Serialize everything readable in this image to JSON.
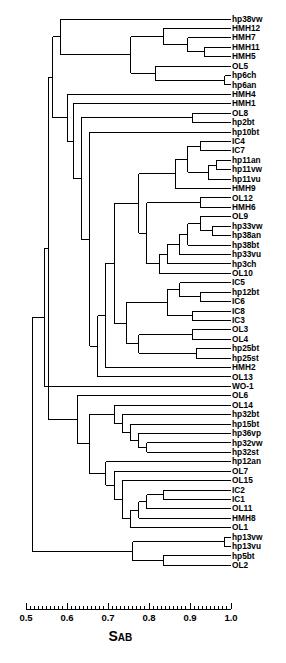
{
  "figure": {
    "kind": "dendrogram",
    "orientation": "horizontal-right-facing",
    "axis_title_main": "S",
    "axis_title_sub": "AB"
  },
  "axis": {
    "label": "SAB",
    "min": 0.5,
    "max": 1.0,
    "major_ticks": [
      0.5,
      0.6,
      0.7,
      0.8,
      0.9,
      1.0
    ],
    "tick_labels": [
      "0.5",
      "0.6",
      "0.7",
      "0.8",
      "0.9",
      "1.0"
    ],
    "minor_tick_step": 0.01,
    "pixel_min_x": 26,
    "pixel_max_x": 231
  },
  "chart_data": {
    "type": "dendrogram",
    "title": "",
    "xlabel": "SAB",
    "ylabel": "",
    "xlim": [
      0.5,
      1.0
    ],
    "grid": false,
    "legend": "none",
    "n_leaves": 64,
    "leaves": [
      "hp38vw",
      "HMH12",
      "HMH7",
      "HMH11",
      "HMH5",
      "OL5",
      "hp6ch",
      "hp6an",
      "HMH4",
      "HMH1",
      "OL8",
      "hp2bt",
      "hp10bt",
      "IC4",
      "IC7",
      "hp11an",
      "hp11vw",
      "hp11vu",
      "HMH9",
      "OL12",
      "HMH6",
      "OL9",
      "hp33vw",
      "hp38an",
      "hp38bt",
      "hp33vu",
      "hp3ch",
      "OL10",
      "IC5",
      "hp12bt",
      "IC6",
      "IC8",
      "IC3",
      "OL3",
      "OL4",
      "hp25bt",
      "hp25st",
      "HMH2",
      "OL13",
      "WO-1",
      "OL6",
      "OL14",
      "hp32bt",
      "hp15bt",
      "hp36vp",
      "hp32vw",
      "hp32st",
      "hp12an",
      "OL7",
      "OL15",
      "IC2",
      "IC1",
      "OL11",
      "HMH8",
      "OL1",
      "hp13vw",
      "hp13vu",
      "hp5bt",
      "OL2"
    ],
    "leaf_tip_similarity": 1.0,
    "merges": [
      {
        "id": "m1",
        "members": [
          "hp6ch",
          "hp6an"
        ],
        "similarity": 0.985
      },
      {
        "id": "m2",
        "members": [
          "HMH11",
          "HMH5"
        ],
        "similarity": 0.935
      },
      {
        "id": "m3",
        "members": [
          "HMH7",
          "m2"
        ],
        "similarity": 0.895
      },
      {
        "id": "m4",
        "members": [
          "HMH12",
          "m3"
        ],
        "similarity": 0.835
      },
      {
        "id": "m5",
        "members": [
          "OL5",
          "m1"
        ],
        "similarity": 0.815
      },
      {
        "id": "m6",
        "members": [
          "m4",
          "m5"
        ],
        "similarity": 0.755
      },
      {
        "id": "m7",
        "members": [
          "hp38vw",
          "m6"
        ],
        "similarity": 0.585
      },
      {
        "id": "m8",
        "members": [
          "OL8",
          "hp2bt"
        ],
        "similarity": 0.905
      },
      {
        "id": "m9",
        "members": [
          "IC4",
          "IC7"
        ],
        "similarity": 0.925
      },
      {
        "id": "m10",
        "members": [
          "hp11an",
          "hp11vw"
        ],
        "similarity": 0.965
      },
      {
        "id": "m11",
        "members": [
          "m10",
          "hp11vu"
        ],
        "similarity": 0.945
      },
      {
        "id": "m12",
        "members": [
          "m9",
          "m11"
        ],
        "similarity": 0.895
      },
      {
        "id": "m13",
        "members": [
          "m12",
          "HMH9"
        ],
        "similarity": 0.865
      },
      {
        "id": "m14",
        "members": [
          "OL12",
          "HMH6"
        ],
        "similarity": 0.925
      },
      {
        "id": "m15",
        "members": [
          "hp33vw",
          "hp38an"
        ],
        "similarity": 0.955
      },
      {
        "id": "m16",
        "members": [
          "OL9",
          "m15"
        ],
        "similarity": 0.925
      },
      {
        "id": "m17",
        "members": [
          "m16",
          "hp38bt"
        ],
        "similarity": 0.895
      },
      {
        "id": "m18",
        "members": [
          "m17",
          "hp33vu"
        ],
        "similarity": 0.875
      },
      {
        "id": "m19",
        "members": [
          "m18",
          "hp3ch"
        ],
        "similarity": 0.845
      },
      {
        "id": "m20",
        "members": [
          "m19",
          "OL10"
        ],
        "similarity": 0.825
      },
      {
        "id": "m21",
        "members": [
          "m14",
          "m20"
        ],
        "similarity": 0.795
      },
      {
        "id": "m22",
        "members": [
          "m13",
          "m21"
        ],
        "similarity": 0.775
      },
      {
        "id": "m23",
        "members": [
          "hp12bt",
          "IC6"
        ],
        "similarity": 0.925
      },
      {
        "id": "m24",
        "members": [
          "IC5",
          "m23"
        ],
        "similarity": 0.875
      },
      {
        "id": "m25",
        "members": [
          "IC8",
          "IC3"
        ],
        "similarity": 0.905
      },
      {
        "id": "m26",
        "members": [
          "m24",
          "m25"
        ],
        "similarity": 0.845
      },
      {
        "id": "m27",
        "members": [
          "OL3",
          "OL4"
        ],
        "similarity": 0.905
      },
      {
        "id": "m28",
        "members": [
          "hp25bt",
          "hp25st"
        ],
        "similarity": 0.915
      },
      {
        "id": "m29",
        "members": [
          "m27",
          "m28"
        ],
        "similarity": 0.775
      },
      {
        "id": "m30",
        "members": [
          "m26",
          "m29"
        ],
        "similarity": 0.745
      },
      {
        "id": "m31",
        "members": [
          "m22",
          "m30"
        ],
        "similarity": 0.715
      },
      {
        "id": "m32",
        "members": [
          "m31",
          "HMH2"
        ],
        "similarity": 0.695
      },
      {
        "id": "m33",
        "members": [
          "m32",
          "OL13"
        ],
        "similarity": 0.675
      },
      {
        "id": "m34",
        "members": [
          "hp10bt",
          "m33"
        ],
        "similarity": 0.655
      },
      {
        "id": "m35",
        "members": [
          "m8",
          "m34"
        ],
        "similarity": 0.635
      },
      {
        "id": "m36",
        "members": [
          "HMH1",
          "m35"
        ],
        "similarity": 0.615
      },
      {
        "id": "m37",
        "members": [
          "HMH4",
          "m36"
        ],
        "similarity": 0.6
      },
      {
        "id": "m38",
        "members": [
          "m7",
          "m37"
        ],
        "similarity": 0.565
      },
      {
        "id": "m39",
        "members": [
          "hp32vw",
          "hp32st"
        ],
        "similarity": 0.795
      },
      {
        "id": "m40",
        "members": [
          "hp36vp",
          "m39"
        ],
        "similarity": 0.775
      },
      {
        "id": "m41",
        "members": [
          "hp15bt",
          "m40"
        ],
        "similarity": 0.755
      },
      {
        "id": "m42",
        "members": [
          "hp32bt",
          "m41"
        ],
        "similarity": 0.735
      },
      {
        "id": "m43",
        "members": [
          "OL14",
          "m42"
        ],
        "similarity": 0.715
      },
      {
        "id": "m44",
        "members": [
          "IC2",
          "IC1"
        ],
        "similarity": 0.835
      },
      {
        "id": "m45",
        "members": [
          "m44",
          "OL11"
        ],
        "similarity": 0.795
      },
      {
        "id": "m46",
        "members": [
          "m45",
          "HMH8"
        ],
        "similarity": 0.775
      },
      {
        "id": "m47",
        "members": [
          "m46",
          "OL1"
        ],
        "similarity": 0.755
      },
      {
        "id": "m48",
        "members": [
          "OL15",
          "m47"
        ],
        "similarity": 0.735
      },
      {
        "id": "m49",
        "members": [
          "OL7",
          "m48"
        ],
        "similarity": 0.715
      },
      {
        "id": "m50",
        "members": [
          "hp12an",
          "m49"
        ],
        "similarity": 0.695
      },
      {
        "id": "m51",
        "members": [
          "m43",
          "m50"
        ],
        "similarity": 0.655
      },
      {
        "id": "m52",
        "members": [
          "OL6",
          "m51"
        ],
        "similarity": 0.625
      },
      {
        "id": "m53",
        "members": [
          "m38",
          "m52"
        ],
        "similarity": 0.555
      },
      {
        "id": "m54",
        "members": [
          "WO-1",
          "m53"
        ],
        "similarity": 0.545
      },
      {
        "id": "m55",
        "members": [
          "hp13vw",
          "hp13vu"
        ],
        "similarity": 0.985
      },
      {
        "id": "m56",
        "members": [
          "hp5bt",
          "OL2"
        ],
        "similarity": 0.835
      },
      {
        "id": "m57",
        "members": [
          "m55",
          "m56"
        ],
        "similarity": 0.76
      },
      {
        "id": "root",
        "members": [
          "m54",
          "m57"
        ],
        "similarity": 0.515
      }
    ]
  },
  "style": {
    "line_color": "#000000",
    "background": "#ffffff",
    "line_width_px": 1
  }
}
